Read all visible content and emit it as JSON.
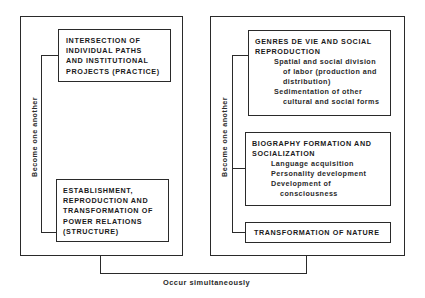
{
  "left_panel": {
    "relation_label": "Become one another",
    "top_box": {
      "title": "INTERSECTION OF\nINDIVIDUAL PATHS\nAND INSTITUTIONAL\nPROJECTS (PRACTICE)"
    },
    "bottom_box": {
      "title": "ESTABLISHMENT,\nREPRODUCTION AND\nTRANSFORMATION OF\nPOWER RELATIONS\n(STRUCTURE)"
    }
  },
  "right_panel": {
    "relation_label": "Become one another",
    "box1": {
      "title": "GENRES DE VIE AND SOCIAL\nREPRODUCTION",
      "items": [
        {
          "line1": "Spatial and social division",
          "cont": [
            "of labor (production and",
            "distribution)"
          ]
        },
        {
          "line1": "Sedimentation of other",
          "cont": [
            "cultural and social forms"
          ]
        }
      ]
    },
    "box2": {
      "title": "BIOGRAPHY FORMATION AND\nSOCIALIZATION",
      "items": [
        {
          "line1": "Language acquisition",
          "cont": []
        },
        {
          "line1": "Personality development",
          "cont": []
        },
        {
          "line1": "Development of",
          "cont": [
            "consciousness"
          ]
        }
      ]
    },
    "box3": {
      "title": "TRANSFORMATION OF NATURE"
    }
  },
  "bottom_connector": {
    "label": "Occur simultaneously"
  }
}
